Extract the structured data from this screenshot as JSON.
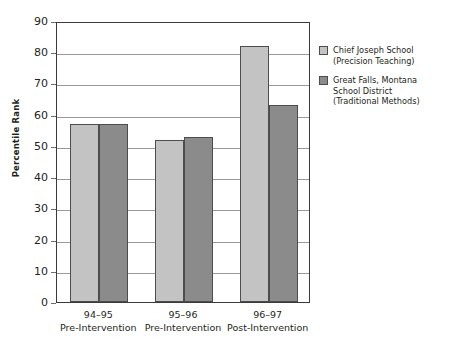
{
  "chart_data": {
    "type": "bar",
    "title": "",
    "subtitle": "",
    "xlabel": "",
    "ylabel": "Percentile Rank",
    "ylim": [
      0,
      90
    ],
    "ytick_step": 10,
    "yticks": [
      90,
      80,
      70,
      60,
      50,
      40,
      30,
      20,
      10,
      0
    ],
    "grid": "horizontal",
    "legend_position": "right",
    "categories": [
      "94–95",
      "95–96",
      "96–97"
    ],
    "category_sublabels": [
      "Pre-Intervention",
      "Pre-Intervention",
      "Post-Intervention"
    ],
    "series": [
      {
        "name": "Chief Joseph School (Precision Teaching)",
        "values": [
          57,
          52,
          82
        ],
        "color": "#c3c3c3"
      },
      {
        "name": "Great Falls, Montana School District (Traditional Methods)",
        "values": [
          57,
          53,
          63
        ],
        "color": "#8b8b8b"
      }
    ]
  },
  "axis": {
    "y_title": "Percentile Rank",
    "y_tick_labels": [
      "90",
      "80",
      "70",
      "60",
      "50",
      "40",
      "30",
      "20",
      "10",
      "0"
    ],
    "x_groups": [
      {
        "year": "94–95",
        "phase": "Pre-Intervention"
      },
      {
        "year": "95–96",
        "phase": "Pre-Intervention"
      },
      {
        "year": "96–97",
        "phase": "Post-Intervention"
      }
    ]
  },
  "legend": {
    "entries": [
      {
        "line1": "Chief Joseph School",
        "line2": "(Precision Teaching)",
        "line3": "",
        "color": "#c3c3c3"
      },
      {
        "line1": "Great Falls, Montana",
        "line2": "School District",
        "line3": "(Traditional Methods)",
        "color": "#8b8b8b"
      }
    ]
  },
  "colors": {
    "series_light": "#c3c3c3",
    "series_dark": "#8b8b8b",
    "bar_border": "#4d4d4d",
    "axis_line": "#3a3a3a",
    "gridline": "#9a9a9a",
    "text": "#231f20",
    "background": "#ffffff"
  }
}
